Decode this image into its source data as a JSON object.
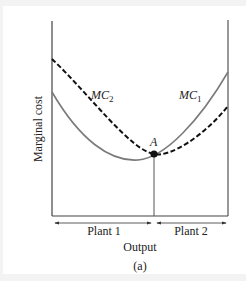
{
  "figure": {
    "y_axis_label": "Marginal cost",
    "x_axis_label": "Output",
    "caption": "(a)",
    "curves": [
      {
        "name": "MC1",
        "label_main": "MC",
        "label_sub": "1",
        "style": "solid",
        "color": "#7a7a7a"
      },
      {
        "name": "MC2",
        "label_main": "MC",
        "label_sub": "2",
        "style": "dashed",
        "color": "#111111"
      }
    ],
    "point": {
      "label": "A"
    },
    "ranges": [
      {
        "label": "Plant 1"
      },
      {
        "label": "Plant 2"
      }
    ]
  }
}
